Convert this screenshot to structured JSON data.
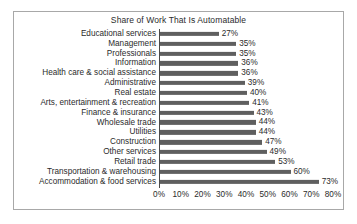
{
  "chart_data": {
    "type": "bar",
    "orientation": "horizontal",
    "title": "Share of Work That Is Automatable",
    "xlabel": "",
    "ylabel": "",
    "xlim": [
      0,
      80
    ],
    "xtick_labels": [
      "0%",
      "10%",
      "20%",
      "30%",
      "40%",
      "50%",
      "60%",
      "70%",
      "80%"
    ],
    "xticks": [
      0,
      10,
      20,
      30,
      40,
      50,
      60,
      70,
      80
    ],
    "grid": false,
    "legend": null,
    "bar_color": "#5f5f5f",
    "categories": [
      "Educational services",
      "Management",
      "Professionals",
      "Information",
      "Health care & social assistance",
      "Administrative",
      "Real estate",
      "Arts, entertainment & recreation",
      "Finance & insurance",
      "Wholesale trade",
      "Utilities",
      "Construction",
      "Other services",
      "Retail trade",
      "Transportation & warehousing",
      "Accommodation & food services"
    ],
    "values": [
      27,
      35,
      35,
      36,
      36,
      39,
      40,
      41,
      43,
      44,
      44,
      47,
      49,
      53,
      60,
      73
    ],
    "data_labels": [
      "27%",
      "35%",
      "35%",
      "36%",
      "36%",
      "39%",
      "40%",
      "41%",
      "43%",
      "44%",
      "44%",
      "47%",
      "49%",
      "53%",
      "60%",
      "73%"
    ]
  }
}
